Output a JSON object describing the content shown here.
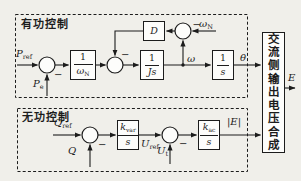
{
  "diagram": {
    "section_titles": {
      "active": "有功控制",
      "reactive": "无功控制"
    },
    "output_block_label": "交流侧输出电压合成",
    "signals": {
      "p_ref": {
        "base": "P",
        "sub": "ref"
      },
      "p_e": {
        "base": "P",
        "sub": "e"
      },
      "omega": "ω",
      "omega_n": {
        "base": "ω",
        "sub": "N"
      },
      "theta": "θ",
      "q_ref": {
        "base": "Q",
        "sub": "ref"
      },
      "q": "Q",
      "u_ref": {
        "base": "U",
        "sub": "ref"
      },
      "u_t": {
        "base": "U",
        "sub": "t"
      },
      "e_magnitude": "|E|",
      "e_output": "E",
      "minus": "−"
    },
    "blocks": {
      "damping": "D",
      "inv_omega_n": {
        "num": "1",
        "den": {
          "base": "ω",
          "sub": "N"
        }
      },
      "inv_js": {
        "num": "1",
        "den": "Js"
      },
      "integrator": {
        "num": "1",
        "den": "s"
      },
      "k_var": {
        "num": {
          "base": "k",
          "sub": "var"
        },
        "den": "s"
      },
      "k_ac": {
        "num": {
          "base": "k",
          "sub": "ac"
        },
        "den": "s"
      }
    },
    "colors": {
      "line": "#1c1c1c",
      "background": "#f0efea",
      "block_fill": "#fdfdfb"
    }
  }
}
